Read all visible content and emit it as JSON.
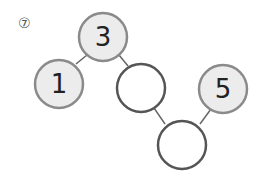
{
  "problem_number": "⑦",
  "nodes": [
    {
      "id": "top",
      "value": "3",
      "filled": true
    },
    {
      "id": "left",
      "value": "1",
      "filled": true
    },
    {
      "id": "middle",
      "value": "",
      "filled": false
    },
    {
      "id": "right",
      "value": "5",
      "filled": true
    },
    {
      "id": "bottom",
      "value": "",
      "filled": false
    }
  ],
  "colors": {
    "filled": "#ececec",
    "stroke_filled": "#8a8a8a",
    "stroke_empty": "#555555",
    "text": "#222222"
  }
}
